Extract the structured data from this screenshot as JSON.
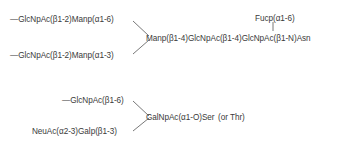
{
  "n_glycan": {
    "branch_a": "—GlcNpAc(β1-2)Manp(α1-6)",
    "branch_b": "—GlcNpAc(β1-2)Manp(α1-3)",
    "core": "Manp(β1-4)GlcNpAc(β1-4)GlcNpAc(β1-N)Asn",
    "fucose": "Fucp(α1-6)"
  },
  "o_glycan": {
    "branch_a": "—GlcNpAc(β1-6)",
    "branch_b": "NeuAc(α2-3)Galp(β1-3)",
    "core": "GalNpAc(α1-O)Ser",
    "note": "(or Thr)"
  }
}
